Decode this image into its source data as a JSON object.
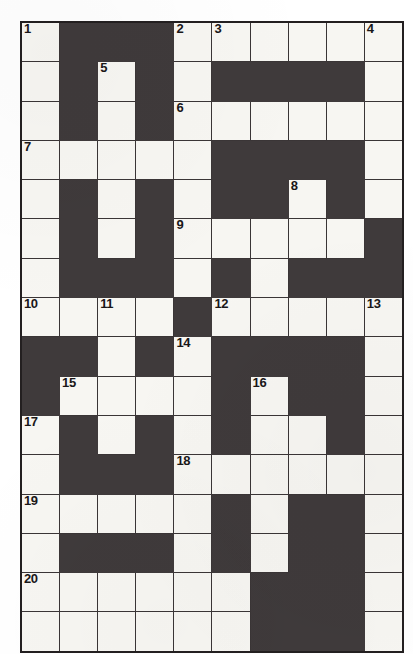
{
  "puzzle": {
    "type": "crossword-grid",
    "columns": 10,
    "rows": 16,
    "colors": {
      "block": "#3f3a3b",
      "open": "#f7f6f2",
      "grid_line": "#3a3536",
      "number": "#1a1718"
    },
    "cells": [
      [
        {
          "block": false,
          "number": "1"
        },
        {
          "block": true,
          "number": ""
        },
        {
          "block": true,
          "number": ""
        },
        {
          "block": true,
          "number": ""
        },
        {
          "block": false,
          "number": "2"
        },
        {
          "block": false,
          "number": "3"
        },
        {
          "block": false,
          "number": ""
        },
        {
          "block": false,
          "number": ""
        },
        {
          "block": false,
          "number": ""
        },
        {
          "block": false,
          "number": "4"
        }
      ],
      [
        {
          "block": false,
          "number": ""
        },
        {
          "block": true,
          "number": ""
        },
        {
          "block": false,
          "number": "5"
        },
        {
          "block": true,
          "number": ""
        },
        {
          "block": false,
          "number": ""
        },
        {
          "block": true,
          "number": ""
        },
        {
          "block": true,
          "number": ""
        },
        {
          "block": true,
          "number": ""
        },
        {
          "block": true,
          "number": ""
        },
        {
          "block": false,
          "number": ""
        }
      ],
      [
        {
          "block": false,
          "number": ""
        },
        {
          "block": true,
          "number": ""
        },
        {
          "block": false,
          "number": ""
        },
        {
          "block": true,
          "number": ""
        },
        {
          "block": false,
          "number": "6"
        },
        {
          "block": false,
          "number": ""
        },
        {
          "block": false,
          "number": ""
        },
        {
          "block": false,
          "number": ""
        },
        {
          "block": false,
          "number": ""
        },
        {
          "block": false,
          "number": ""
        }
      ],
      [
        {
          "block": false,
          "number": "7"
        },
        {
          "block": false,
          "number": ""
        },
        {
          "block": false,
          "number": ""
        },
        {
          "block": false,
          "number": ""
        },
        {
          "block": false,
          "number": ""
        },
        {
          "block": true,
          "number": ""
        },
        {
          "block": true,
          "number": ""
        },
        {
          "block": true,
          "number": ""
        },
        {
          "block": true,
          "number": ""
        },
        {
          "block": false,
          "number": ""
        }
      ],
      [
        {
          "block": false,
          "number": ""
        },
        {
          "block": true,
          "number": ""
        },
        {
          "block": false,
          "number": ""
        },
        {
          "block": true,
          "number": ""
        },
        {
          "block": false,
          "number": ""
        },
        {
          "block": true,
          "number": ""
        },
        {
          "block": true,
          "number": ""
        },
        {
          "block": false,
          "number": "8"
        },
        {
          "block": true,
          "number": ""
        },
        {
          "block": false,
          "number": ""
        }
      ],
      [
        {
          "block": false,
          "number": ""
        },
        {
          "block": true,
          "number": ""
        },
        {
          "block": false,
          "number": ""
        },
        {
          "block": true,
          "number": ""
        },
        {
          "block": false,
          "number": "9"
        },
        {
          "block": false,
          "number": ""
        },
        {
          "block": false,
          "number": ""
        },
        {
          "block": false,
          "number": ""
        },
        {
          "block": false,
          "number": ""
        },
        {
          "block": true,
          "number": ""
        }
      ],
      [
        {
          "block": false,
          "number": ""
        },
        {
          "block": true,
          "number": ""
        },
        {
          "block": true,
          "number": ""
        },
        {
          "block": true,
          "number": ""
        },
        {
          "block": false,
          "number": ""
        },
        {
          "block": true,
          "number": ""
        },
        {
          "block": false,
          "number": ""
        },
        {
          "block": true,
          "number": ""
        },
        {
          "block": true,
          "number": ""
        },
        {
          "block": true,
          "number": ""
        }
      ],
      [
        {
          "block": false,
          "number": "10"
        },
        {
          "block": false,
          "number": ""
        },
        {
          "block": false,
          "number": "11"
        },
        {
          "block": false,
          "number": ""
        },
        {
          "block": true,
          "number": ""
        },
        {
          "block": false,
          "number": "12"
        },
        {
          "block": false,
          "number": ""
        },
        {
          "block": false,
          "number": ""
        },
        {
          "block": false,
          "number": ""
        },
        {
          "block": false,
          "number": "13"
        }
      ],
      [
        {
          "block": true,
          "number": ""
        },
        {
          "block": true,
          "number": ""
        },
        {
          "block": false,
          "number": ""
        },
        {
          "block": true,
          "number": ""
        },
        {
          "block": false,
          "number": "14"
        },
        {
          "block": true,
          "number": ""
        },
        {
          "block": true,
          "number": ""
        },
        {
          "block": true,
          "number": ""
        },
        {
          "block": true,
          "number": ""
        },
        {
          "block": false,
          "number": ""
        }
      ],
      [
        {
          "block": true,
          "number": ""
        },
        {
          "block": false,
          "number": "15"
        },
        {
          "block": false,
          "number": ""
        },
        {
          "block": false,
          "number": ""
        },
        {
          "block": false,
          "number": ""
        },
        {
          "block": true,
          "number": ""
        },
        {
          "block": false,
          "number": "16"
        },
        {
          "block": true,
          "number": ""
        },
        {
          "block": true,
          "number": ""
        },
        {
          "block": false,
          "number": ""
        }
      ],
      [
        {
          "block": false,
          "number": "17"
        },
        {
          "block": true,
          "number": ""
        },
        {
          "block": false,
          "number": ""
        },
        {
          "block": true,
          "number": ""
        },
        {
          "block": false,
          "number": ""
        },
        {
          "block": true,
          "number": ""
        },
        {
          "block": false,
          "number": ""
        },
        {
          "block": false,
          "number": ""
        },
        {
          "block": true,
          "number": ""
        },
        {
          "block": false,
          "number": ""
        }
      ],
      [
        {
          "block": false,
          "number": ""
        },
        {
          "block": true,
          "number": ""
        },
        {
          "block": true,
          "number": ""
        },
        {
          "block": true,
          "number": ""
        },
        {
          "block": false,
          "number": "18"
        },
        {
          "block": false,
          "number": ""
        },
        {
          "block": false,
          "number": ""
        },
        {
          "block": false,
          "number": ""
        },
        {
          "block": false,
          "number": ""
        },
        {
          "block": false,
          "number": ""
        }
      ],
      [
        {
          "block": false,
          "number": "19"
        },
        {
          "block": false,
          "number": ""
        },
        {
          "block": false,
          "number": ""
        },
        {
          "block": false,
          "number": ""
        },
        {
          "block": false,
          "number": ""
        },
        {
          "block": true,
          "number": ""
        },
        {
          "block": false,
          "number": ""
        },
        {
          "block": true,
          "number": ""
        },
        {
          "block": true,
          "number": ""
        },
        {
          "block": false,
          "number": ""
        }
      ],
      [
        {
          "block": false,
          "number": ""
        },
        {
          "block": true,
          "number": ""
        },
        {
          "block": true,
          "number": ""
        },
        {
          "block": true,
          "number": ""
        },
        {
          "block": false,
          "number": ""
        },
        {
          "block": true,
          "number": ""
        },
        {
          "block": false,
          "number": ""
        },
        {
          "block": true,
          "number": ""
        },
        {
          "block": true,
          "number": ""
        },
        {
          "block": false,
          "number": ""
        }
      ],
      [
        {
          "block": false,
          "number": "20"
        },
        {
          "block": false,
          "number": ""
        },
        {
          "block": false,
          "number": ""
        },
        {
          "block": false,
          "number": ""
        },
        {
          "block": false,
          "number": ""
        },
        {
          "block": false,
          "number": ""
        },
        {
          "block": true,
          "number": ""
        },
        {
          "block": true,
          "number": ""
        },
        {
          "block": true,
          "number": ""
        },
        {
          "block": false,
          "number": ""
        }
      ],
      [
        {
          "block": false,
          "number": ""
        },
        {
          "block": false,
          "number": ""
        },
        {
          "block": false,
          "number": ""
        },
        {
          "block": false,
          "number": ""
        },
        {
          "block": false,
          "number": ""
        },
        {
          "block": false,
          "number": ""
        },
        {
          "block": true,
          "number": ""
        },
        {
          "block": true,
          "number": ""
        },
        {
          "block": true,
          "number": ""
        },
        {
          "block": false,
          "number": ""
        }
      ]
    ]
  },
  "bleed_through": {
    "heading_across": "ACROSS",
    "heading_down": "DOWN",
    "line_1": "OS",
    "line_2": "OS"
  }
}
